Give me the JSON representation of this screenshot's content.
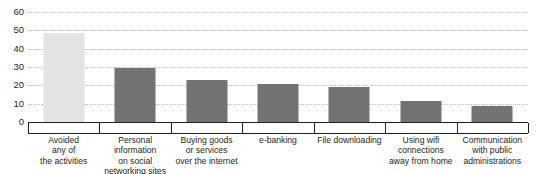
{
  "chart_data": {
    "type": "bar",
    "title": "",
    "subtitle": "",
    "xlabel": "",
    "ylabel": "",
    "ylim": [
      0,
      60
    ],
    "yticks": [
      0,
      10,
      20,
      30,
      40,
      50,
      60
    ],
    "ytick_labels": [
      "0",
      "10",
      "20",
      "30",
      "40",
      "50",
      "60"
    ],
    "grid": true,
    "legend": "none",
    "categories": [
      "Avoided\nany of\nthe activities",
      "Personal\ninformation\non social\nnetworking sites",
      "Buying goods\nor services\nover the internet",
      "e-banking",
      "File downloading",
      "Using wifi\nconnections\naway from home",
      "Communication\nwith public\nadministrations"
    ],
    "values": [
      48.5,
      29.5,
      23,
      21,
      19,
      11.5,
      8.5
    ],
    "bar_colors": [
      "#e3e3e3",
      "#737373",
      "#737373",
      "#737373",
      "#737373",
      "#737373",
      "#737373"
    ],
    "highlight_color": "#e3e3e3",
    "series_color": "#737373",
    "axis_color": "#231f20",
    "grid_color": "#bdbdbd"
  },
  "categories_lines": [
    [
      "Avoided",
      "any of",
      "the activities"
    ],
    [
      "Personal",
      "information",
      "on social",
      "networking sites"
    ],
    [
      "Buying goods",
      "or services",
      "over the internet"
    ],
    [
      "e-banking"
    ],
    [
      "File downloading"
    ],
    [
      "Using wifi",
      "connections",
      "away from home"
    ],
    [
      "Communication",
      "with public",
      "administrations"
    ]
  ]
}
